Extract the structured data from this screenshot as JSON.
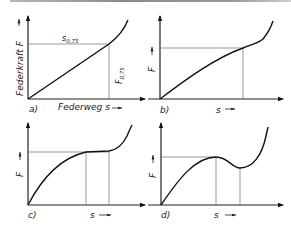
{
  "figure": {
    "panels": [
      {
        "id": "a",
        "label": "a)",
        "y_axis_label": "Federkraft F",
        "x_axis_label": "Federweg s",
        "curve_type": "linear then progressive",
        "annotation_top": "s",
        "annotation_top_sub": "0,75",
        "annotation_vertical": "F",
        "annotation_vertical_sub": "0,75"
      },
      {
        "id": "b",
        "label": "b)",
        "y_axis_label": "F",
        "x_axis_label": "s",
        "curve_type": "degressive then progressive"
      },
      {
        "id": "c",
        "label": "c)",
        "y_axis_label": "F",
        "x_axis_label": "s",
        "curve_type": "degressive with plateau then progressive"
      },
      {
        "id": "d",
        "label": "d)",
        "y_axis_label": "F",
        "x_axis_label": "s",
        "curve_type": "local maximum and minimum then progressive"
      }
    ]
  }
}
